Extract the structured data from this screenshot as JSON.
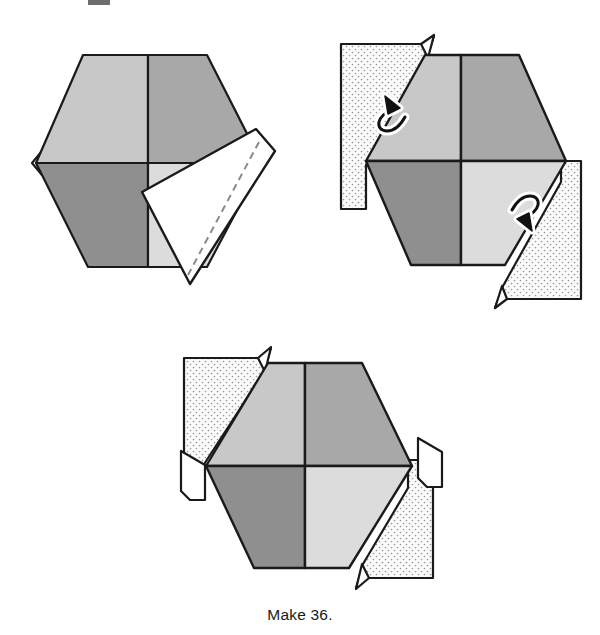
{
  "page": {
    "background_color": "#ffffff",
    "width": 600,
    "height": 635
  },
  "caption": {
    "text": "Make 36."
  },
  "colors": {
    "outline": "#1a1a1a",
    "quad_top_left": "#c8c8c8",
    "quad_top_right": "#a8a8a8",
    "quad_bottom_left": "#8f8f8f",
    "quad_bottom_right": "#dcdcdc",
    "flap_white": "#ffffff",
    "flap_stipple_base": "#fbfbfb",
    "stipple_dot": "#9a9a9a",
    "dashed_seam": "#7a7a7a",
    "arrow_fill": "#111111",
    "arrow_outline": "#ffffff"
  },
  "figures": [
    {
      "id": "figure-1",
      "step": 1,
      "label": "hexagon with single white flap folded out at right",
      "hexagon": {
        "quadrants": [
          {
            "name": "top-left",
            "shade": "#c8c8c8"
          },
          {
            "name": "top-right",
            "shade": "#a8a8a8"
          },
          {
            "name": "bottom-left",
            "shade": "#8f8f8f"
          },
          {
            "name": "bottom-right",
            "shade": "#dcdcdc"
          }
        ]
      },
      "flaps": [
        {
          "name": "right-white-flap",
          "fill": "white",
          "has_dashed_seam": true
        },
        {
          "name": "left-small-tab",
          "fill": "white",
          "has_dashed_seam": false
        }
      ],
      "arrows": []
    },
    {
      "id": "figure-2",
      "step": 2,
      "label": "hexagon with two stippled flaps folded out and curved arrows",
      "hexagon": {
        "quadrants": [
          {
            "name": "top-left",
            "shade": "#c8c8c8"
          },
          {
            "name": "top-right",
            "shade": "#a8a8a8"
          },
          {
            "name": "bottom-left",
            "shade": "#8f8f8f"
          },
          {
            "name": "bottom-right",
            "shade": "#dcdcdc"
          }
        ]
      },
      "flaps": [
        {
          "name": "upper-left-stipple-flap",
          "fill": "stipple",
          "has_tab": true
        },
        {
          "name": "lower-right-stipple-flap",
          "fill": "stipple",
          "has_tab": true
        }
      ],
      "arrows": [
        {
          "name": "fold-arrow-upper-left",
          "direction": "up-left"
        },
        {
          "name": "fold-arrow-lower-right",
          "direction": "down-right"
        }
      ]
    },
    {
      "id": "figure-3",
      "step": 3,
      "label": "completed hexagon block with stippled flaps laid flat",
      "hexagon": {
        "quadrants": [
          {
            "name": "top-left",
            "shade": "#c8c8c8"
          },
          {
            "name": "top-right",
            "shade": "#a8a8a8"
          },
          {
            "name": "bottom-left",
            "shade": "#8f8f8f"
          },
          {
            "name": "bottom-right",
            "shade": "#dcdcdc"
          }
        ]
      },
      "flaps": [
        {
          "name": "upper-left-stipple-flap",
          "fill": "stipple",
          "has_tab": true
        },
        {
          "name": "lower-right-stipple-flap",
          "fill": "stipple",
          "has_tab": true
        },
        {
          "name": "left-white-tab",
          "fill": "white",
          "has_tab": true
        },
        {
          "name": "right-white-tab",
          "fill": "white",
          "has_tab": true
        }
      ],
      "arrows": []
    }
  ]
}
